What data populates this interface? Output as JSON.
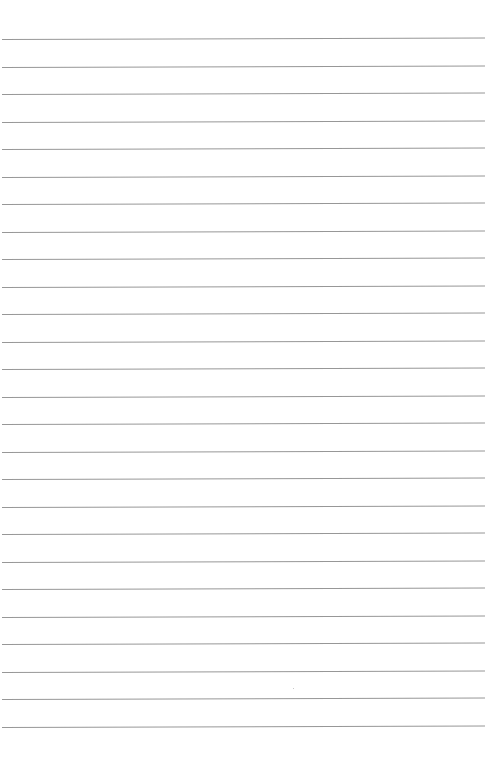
{
  "page": {
    "type": "lined-paper",
    "background_color": "#ffffff",
    "rule_color": "#8c8c8c",
    "rule_count": 26,
    "first_rule_y": 39,
    "rule_spacing": 27.5,
    "rule_left": 2,
    "rule_width": 483,
    "text_content": []
  }
}
